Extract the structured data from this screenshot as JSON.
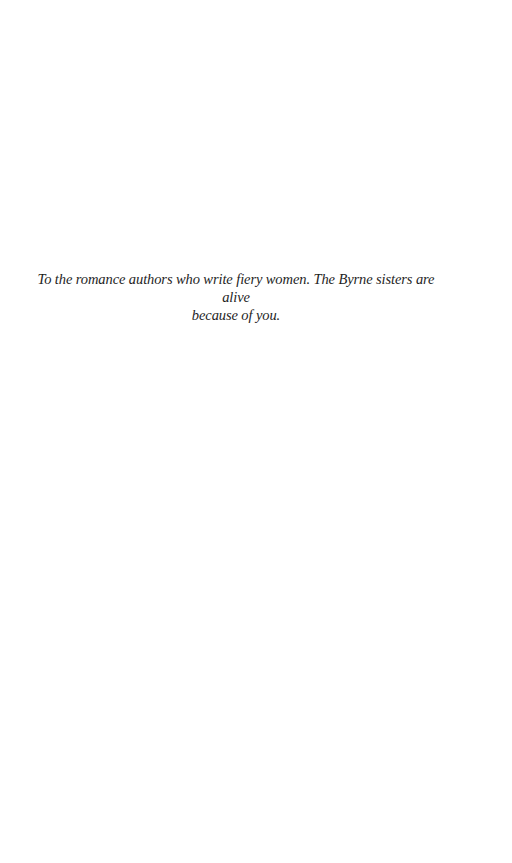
{
  "dedication": {
    "line1": "To the romance authors who write fiery women. The Byrne sisters are alive",
    "line2": "because of you."
  }
}
